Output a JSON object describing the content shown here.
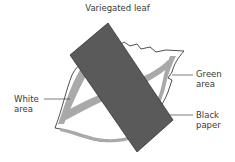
{
  "diagram": {
    "title": "Variegated leaf",
    "labels": {
      "white_area": [
        "White",
        "area"
      ],
      "green_area": [
        "Green",
        "area"
      ],
      "black_paper": [
        "Black",
        "paper"
      ]
    },
    "colors": {
      "leaf_fill": "#ffffff",
      "leaf_outline": "#222222",
      "green_band": "#a9a9a9",
      "paper": "#5a5a5a",
      "paper_outline": "#333333",
      "leader_line": "#444444"
    }
  }
}
